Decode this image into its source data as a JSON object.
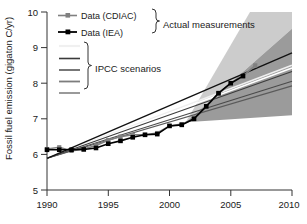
{
  "chart_data": {
    "type": "line",
    "title": "",
    "xlabel": "",
    "ylabel": "Fossil fuel emission (gigaton C/yr)",
    "xlim": [
      1990,
      2010
    ],
    "ylim": [
      5,
      10
    ],
    "xticks": [
      "1990",
      "1995",
      "2000",
      "2005",
      "2010"
    ],
    "xtick_values": [
      1990,
      1995,
      2000,
      2005,
      2010
    ],
    "yticks": [
      "5",
      "6",
      "7",
      "8",
      "9",
      "10"
    ],
    "ytick_values": [
      5,
      6,
      7,
      8,
      9,
      10
    ],
    "grid": false,
    "legend_position": "upper-left",
    "series": [
      {
        "name": "Data (CDIAC)",
        "color": "#808080",
        "marker": "square",
        "x": [
          1990,
          1991,
          1992,
          1993,
          1994,
          1995,
          1996,
          1997,
          1998,
          1999,
          2000,
          2001,
          2002,
          2003,
          2004,
          2005,
          2006,
          2007
        ],
        "values": [
          6.15,
          6.2,
          6.1,
          6.15,
          6.25,
          6.4,
          6.5,
          6.55,
          6.55,
          6.6,
          6.8,
          6.85,
          7.0,
          7.35,
          7.7,
          8.0,
          8.2,
          8.5
        ]
      },
      {
        "name": "Data (IEA)",
        "color": "#000000",
        "marker": "square",
        "x": [
          1990,
          1991,
          1992,
          1993,
          1994,
          1995,
          1996,
          1997,
          1998,
          1999,
          2000,
          2001,
          2002,
          2003,
          2004,
          2005,
          2006
        ],
        "values": [
          6.13,
          6.13,
          6.13,
          6.14,
          6.18,
          6.3,
          6.38,
          6.48,
          6.55,
          6.57,
          6.8,
          6.83,
          7.0,
          7.35,
          7.72,
          8.0,
          8.2
        ]
      }
    ],
    "scenario_band": {
      "name": "IPCC scenario range",
      "color": "#9a9a9a",
      "x_start": 1990,
      "x_end": 2010,
      "y_start": 6.85,
      "y_upper_end": 9.45,
      "y_lower_end": 7.1
    },
    "scenario_lines": [
      {
        "name": "scenario-1",
        "color": "#f2f2f2",
        "x_start": 1990,
        "y_start": 5.88,
        "x_end": 2010,
        "y_end": 8.5
      },
      {
        "name": "scenario-2",
        "color": "#ffffff",
        "x_start": 1990,
        "y_start": 5.88,
        "x_end": 2010,
        "y_end": 8.42
      },
      {
        "name": "scenario-3",
        "color": "#3a3a3a",
        "x_start": 1990,
        "y_start": 5.88,
        "x_end": 2010,
        "y_end": 8.32
      },
      {
        "name": "scenario-4",
        "color": "#4a4a4a",
        "x_start": 1990,
        "y_start": 5.88,
        "x_end": 2010,
        "y_end": 8.05
      },
      {
        "name": "scenario-5",
        "color": "#5a5a5a",
        "x_start": 1990,
        "y_start": 5.88,
        "x_end": 2010,
        "y_end": 7.92
      },
      {
        "name": "scenario-top-black",
        "color": "#111111",
        "x_start": 1990,
        "y_start": 5.88,
        "x_end": 2010,
        "y_end": 8.85
      }
    ],
    "annotations": [
      {
        "name": "actual-measurements",
        "text": "Actual measurements"
      },
      {
        "name": "ipcc-scenarios",
        "text": "IPCC scenarios"
      }
    ]
  },
  "legend": {
    "entries": [
      {
        "label": "Data (CDIAC)",
        "color": "#808080"
      },
      {
        "label": "Data (IEA)",
        "color": "#000000"
      }
    ],
    "bracket_label_top": "Actual measurements",
    "bracket_label_bottom": "IPCC scenarios",
    "scenario_swatches": [
      {
        "name": "ipcc-swatch-1",
        "color": "#f0f0f0"
      },
      {
        "name": "ipcc-swatch-2",
        "color": "#3a3a3a"
      },
      {
        "name": "ipcc-swatch-3",
        "color": "#555555"
      },
      {
        "name": "ipcc-swatch-4",
        "color": "#7a7a7a"
      },
      {
        "name": "ipcc-swatch-5",
        "color": "#8c8c8c"
      }
    ]
  },
  "axis": {
    "y_title": "Fossil fuel emission (gigaton C/yr)"
  }
}
